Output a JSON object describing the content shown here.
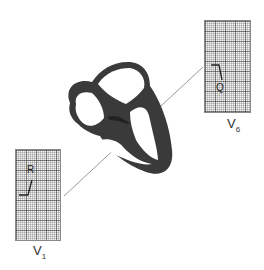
{
  "diagram": {
    "leads": [
      {
        "id": "V1",
        "letter": "V",
        "subscript": "1",
        "wave_label": "R"
      },
      {
        "id": "V6",
        "letter": "V",
        "subscript": "6",
        "wave_label": "Q"
      }
    ],
    "colors": {
      "heart_wall": "#3a3a3a",
      "grid_line": "#6e6e6e",
      "axis_line": "#9a9a9a"
    }
  }
}
